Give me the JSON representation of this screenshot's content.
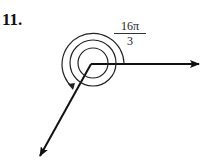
{
  "problem": {
    "number": "11.",
    "angle_label": {
      "numerator": "16π",
      "denominator": "3"
    },
    "angle_radians_text": "16π/3",
    "initial_side": "positive x-axis",
    "terminal_side": "lower-left ray (third quadrant)",
    "rotation": "counterclockwise, 2 full turns plus 4π/3"
  }
}
